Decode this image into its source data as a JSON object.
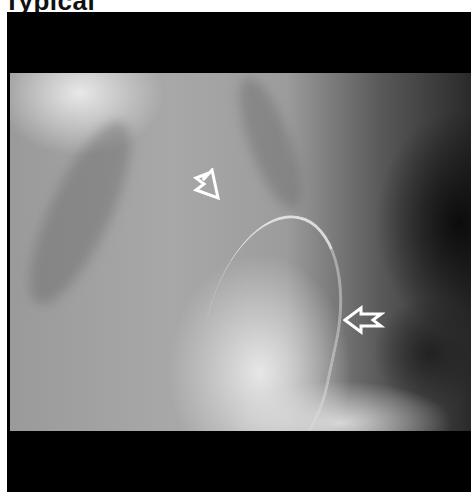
{
  "heading": "Typical",
  "figure": {
    "type": "radiograph",
    "annotations": [
      {
        "id": "open-arrow-upper",
        "direction": "down-right",
        "color": "#ffffff"
      },
      {
        "id": "open-arrow-right",
        "direction": "left",
        "color": "#ffffff"
      }
    ]
  }
}
